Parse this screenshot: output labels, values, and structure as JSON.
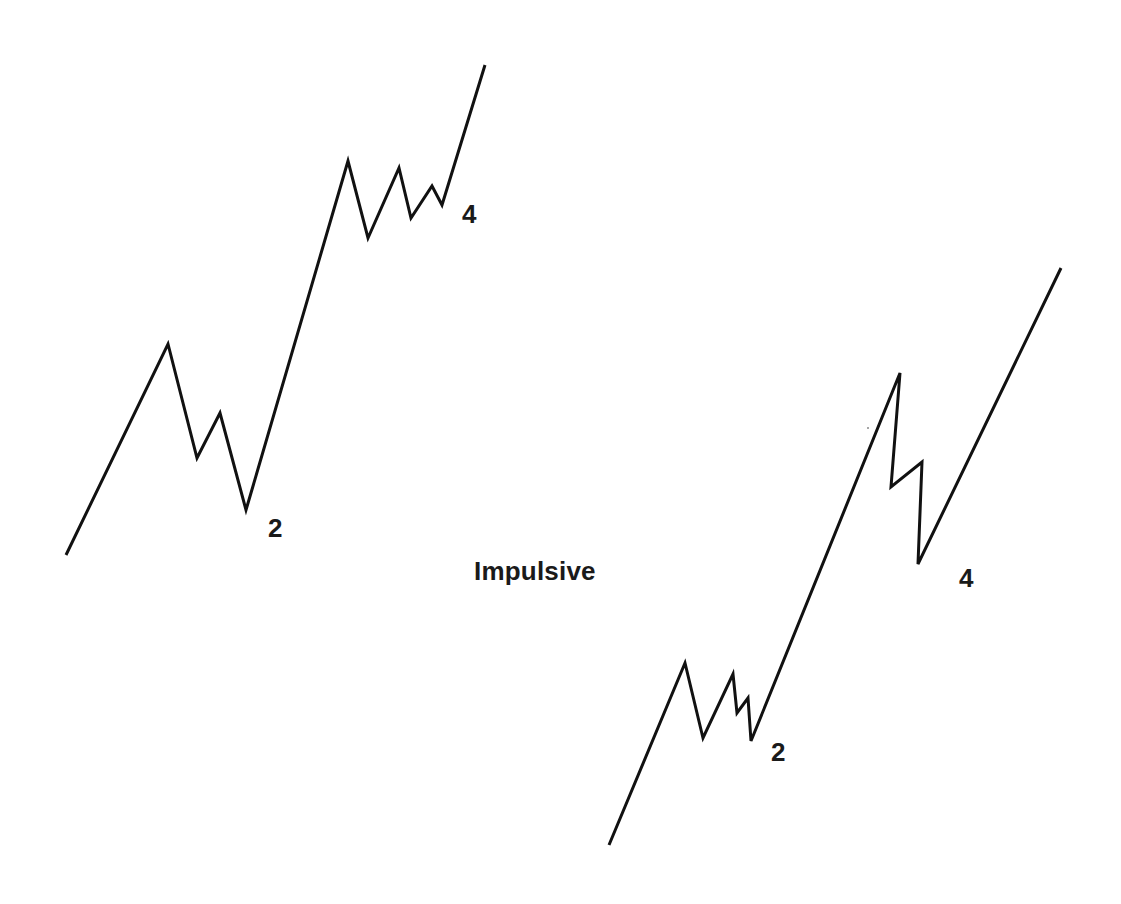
{
  "diagram": {
    "title": "Impulsive",
    "colors": {
      "background": "#ffffff",
      "line": "#111111",
      "text": "#1a1a1a"
    },
    "waves": [
      {
        "name": "left-impulse",
        "points": [
          [
            66,
            555
          ],
          [
            168,
            344
          ],
          [
            197,
            458
          ],
          [
            220,
            413
          ],
          [
            246,
            510
          ],
          [
            348,
            161
          ],
          [
            368,
            238
          ],
          [
            399,
            168
          ],
          [
            411,
            218
          ],
          [
            432,
            186
          ],
          [
            442,
            205
          ],
          [
            485,
            65
          ]
        ],
        "labels": [
          {
            "text": "2",
            "x": 268,
            "y": 515
          },
          {
            "text": "4",
            "x": 462,
            "y": 201
          }
        ]
      },
      {
        "name": "right-impulse",
        "points": [
          [
            609,
            845
          ],
          [
            685,
            663
          ],
          [
            703,
            738
          ],
          [
            733,
            674
          ],
          [
            737,
            713
          ],
          [
            748,
            698
          ],
          [
            751,
            741
          ],
          [
            900,
            373
          ],
          [
            891,
            487
          ],
          [
            922,
            462
          ],
          [
            918,
            564
          ],
          [
            1061,
            268
          ]
        ],
        "labels": [
          {
            "text": "2",
            "x": 771,
            "y": 739
          },
          {
            "text": "4",
            "x": 959,
            "y": 565
          }
        ]
      }
    ],
    "title_position": {
      "x": 474,
      "y": 558
    }
  }
}
